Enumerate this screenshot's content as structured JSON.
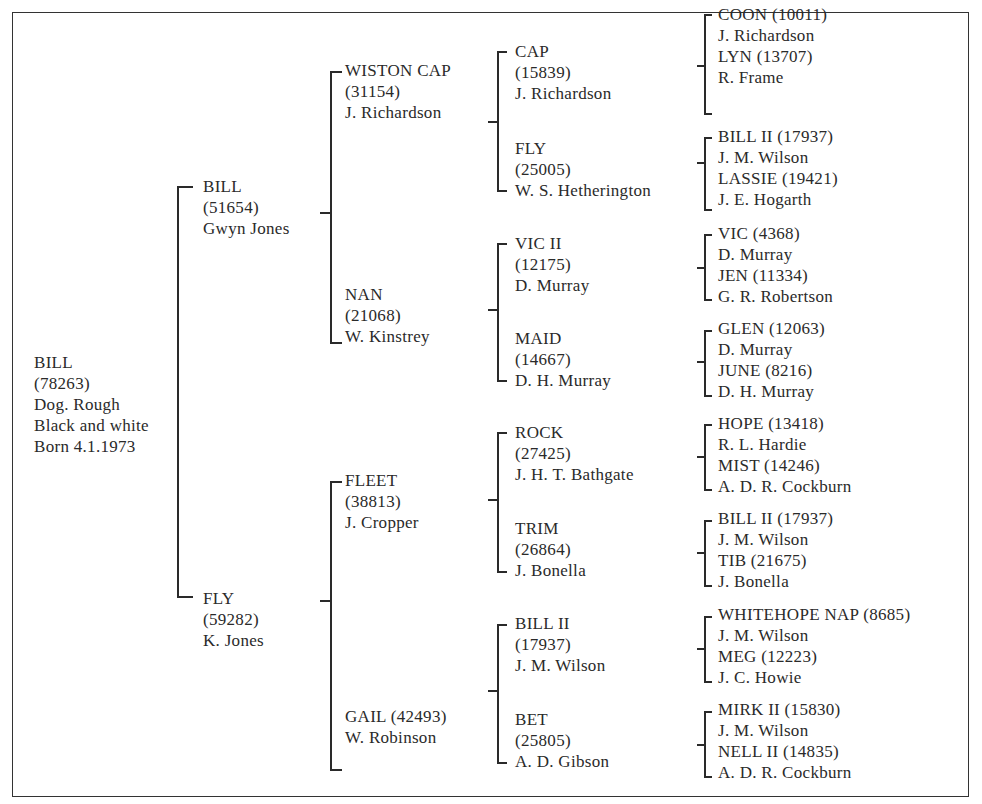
{
  "pedigree": {
    "subject": {
      "name": "BILL",
      "reg": "(78263)",
      "line3": "Dog. Rough",
      "line4": "Black and white",
      "line5": "Born 4.1.1973"
    },
    "sire": {
      "name": "BILL",
      "reg": "(51654)",
      "owner": "Gwyn Jones"
    },
    "dam": {
      "name": "FLY",
      "reg": "(59282)",
      "owner": "K. Jones"
    },
    "gen3": [
      {
        "name": "WISTON CAP",
        "reg": "(31154)",
        "owner": "J. Richardson"
      },
      {
        "name": "NAN",
        "reg": "(21068)",
        "owner": "W. Kinstrey"
      },
      {
        "name": "FLEET",
        "reg": "(38813)",
        "owner": "J. Cropper"
      },
      {
        "name": "GAIL (42493)",
        "reg": "",
        "owner": "W. Robinson"
      }
    ],
    "gen4": [
      {
        "name": "CAP",
        "reg": "(15839)",
        "owner": "J. Richardson"
      },
      {
        "name": "FLY",
        "reg": "(25005)",
        "owner": "W. S. Hetherington"
      },
      {
        "name": "VIC II",
        "reg": "(12175)",
        "owner": "D. Murray"
      },
      {
        "name": "MAID",
        "reg": "(14667)",
        "owner": "D. H. Murray"
      },
      {
        "name": "ROCK",
        "reg": "(27425)",
        "owner": "J. H. T. Bathgate"
      },
      {
        "name": "TRIM",
        "reg": "(26864)",
        "owner": "J. Bonella"
      },
      {
        "name": "BILL II",
        "reg": "(17937)",
        "owner": "J. M. Wilson"
      },
      {
        "name": "BET",
        "reg": "(25805)",
        "owner": "A. D. Gibson"
      }
    ],
    "gen5": [
      {
        "sire": "COON (10011)",
        "sire_owner": "J. Richardson",
        "dam": "LYN (13707)",
        "dam_owner": "R. Frame"
      },
      {
        "sire": "BILL II (17937)",
        "sire_owner": "J. M. Wilson",
        "dam": "LASSIE (19421)",
        "dam_owner": "J. E. Hogarth"
      },
      {
        "sire": "VIC (4368)",
        "sire_owner": "D. Murray",
        "dam": "JEN (11334)",
        "dam_owner": "G. R. Robertson"
      },
      {
        "sire": "GLEN (12063)",
        "sire_owner": "D. Murray",
        "dam": "JUNE (8216)",
        "dam_owner": "D. H. Murray"
      },
      {
        "sire": "HOPE (13418)",
        "sire_owner": "R. L. Hardie",
        "dam": "MIST (14246)",
        "dam_owner": "A. D. R. Cockburn"
      },
      {
        "sire": "BILL II (17937)",
        "sire_owner": "J. M. Wilson",
        "dam": "TIB (21675)",
        "dam_owner": "J. Bonella"
      },
      {
        "sire": "WHITEHOPE NAP (8685)",
        "sire_owner": "J. M. Wilson",
        "dam": "MEG (12223)",
        "dam_owner": "J. C. Howie"
      },
      {
        "sire": "MIRK II (15830)",
        "sire_owner": "J. M. Wilson",
        "dam": "NELL II (14835)",
        "dam_owner": "A. D. R. Cockburn"
      }
    ]
  }
}
